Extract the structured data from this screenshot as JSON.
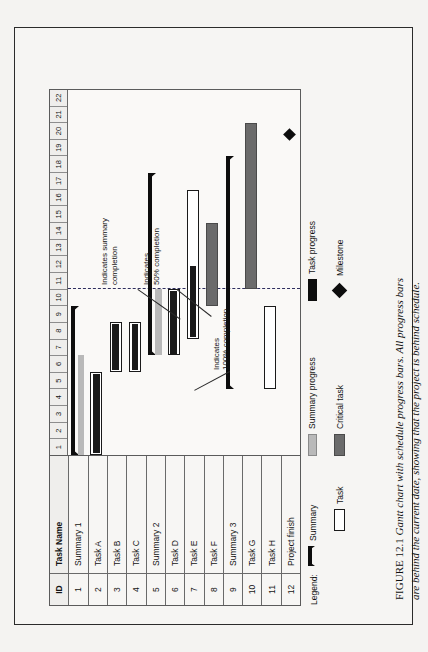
{
  "figure": {
    "caption_label": "FIGURE 12.1",
    "caption_text": "Gantt chart with schedule progress bars. All progress bars are behind the current date, showing that the project is behind schedule."
  },
  "table": {
    "headers": {
      "id": "ID",
      "name": "Task Name"
    },
    "rows": [
      {
        "id": "1",
        "name": "Summary 1"
      },
      {
        "id": "2",
        "name": "Task A"
      },
      {
        "id": "3",
        "name": "Task B"
      },
      {
        "id": "4",
        "name": "Task C"
      },
      {
        "id": "5",
        "name": "Summary 2"
      },
      {
        "id": "6",
        "name": "Task D"
      },
      {
        "id": "7",
        "name": "Task E"
      },
      {
        "id": "8",
        "name": "Task F"
      },
      {
        "id": "9",
        "name": "Summary 3"
      },
      {
        "id": "10",
        "name": "Task G"
      },
      {
        "id": "11",
        "name": "Task H"
      },
      {
        "id": "12",
        "name": "Project finish"
      }
    ]
  },
  "timeline": {
    "columns": [
      "1",
      "2",
      "3",
      "4",
      "5",
      "6",
      "7",
      "8",
      "9",
      "10",
      "11",
      "12",
      "13",
      "14",
      "15",
      "16",
      "17",
      "18",
      "19",
      "20",
      "21",
      "22"
    ],
    "current_date_column": 11
  },
  "annotations": [
    {
      "id": "anno-summary-completion",
      "text": "Indicates summary\ncompletion"
    },
    {
      "id": "anno-50-completion",
      "text": "Indicates\n50% completion"
    },
    {
      "id": "anno-100-completion",
      "text": "Indicates\n100% completion"
    }
  ],
  "legend": {
    "title": "Legend:",
    "items": [
      {
        "id": "legend-summary",
        "label": "Summary",
        "swatch": "summary-bar-icon",
        "color": "#0d0d0d"
      },
      {
        "id": "legend-summary-progress",
        "label": "Summary progress",
        "swatch": "summary-progress-icon",
        "color": "#b9b9b9"
      },
      {
        "id": "legend-task-progress",
        "label": "Task progress",
        "swatch": "task-progress-icon",
        "color": "#0d0d0d"
      },
      {
        "id": "legend-task",
        "label": "Task",
        "swatch": "task-bar-icon",
        "color": "#ffffff"
      },
      {
        "id": "legend-critical-task",
        "label": "Critical task",
        "swatch": "critical-task-icon",
        "color": "#6b6b6b"
      },
      {
        "id": "legend-milestone",
        "label": "Milestone",
        "swatch": "milestone-diamond-icon",
        "color": "#0d0d0d"
      }
    ]
  },
  "chart_data": {
    "type": "bar",
    "title": "Gantt chart with schedule progress bars",
    "xlabel": "",
    "ylabel": "",
    "xlim": [
      1,
      23
    ],
    "grid": true,
    "legend_position": "bottom",
    "current_date": 11,
    "categories": [
      "Summary 1",
      "Task A",
      "Task B",
      "Task C",
      "Summary 2",
      "Task D",
      "Task E",
      "Task F",
      "Summary 3",
      "Task G",
      "Task H",
      "Project finish"
    ],
    "tasks": [
      {
        "id": "1",
        "name": "Summary 1",
        "kind": "summary",
        "start": 1,
        "finish": 9,
        "progress_end": 7,
        "percent_complete": 75
      },
      {
        "id": "2",
        "name": "Task A",
        "kind": "task",
        "start": 1,
        "finish": 5,
        "progress_end": 5,
        "percent_complete": 100
      },
      {
        "id": "3",
        "name": "Task B",
        "kind": "task",
        "start": 6,
        "finish": 8,
        "progress_end": 8,
        "percent_complete": 100
      },
      {
        "id": "4",
        "name": "Task C",
        "kind": "task",
        "start": 6,
        "finish": 8,
        "progress_end": 8,
        "percent_complete": 100
      },
      {
        "id": "5",
        "name": "Summary 2",
        "kind": "summary",
        "start": 7,
        "finish": 17,
        "progress_end": 11,
        "percent_complete": 40
      },
      {
        "id": "6",
        "name": "Task D",
        "kind": "task",
        "start": 7,
        "finish": 10,
        "progress_end": 10,
        "percent_complete": 100
      },
      {
        "id": "7",
        "name": "Task E",
        "kind": "task",
        "start": 8,
        "finish": 16,
        "progress_end": 10,
        "percent_complete": 50
      },
      {
        "id": "8",
        "name": "Task F",
        "kind": "critical",
        "start": 10,
        "finish": 14,
        "progress_end": 10,
        "percent_complete": 0
      },
      {
        "id": "9",
        "name": "Summary 3",
        "kind": "summary",
        "start": 5,
        "finish": 18,
        "progress_end": 5,
        "percent_complete": 0
      },
      {
        "id": "10",
        "name": "Task G",
        "kind": "critical",
        "start": 11,
        "finish": 20,
        "progress_end": 11,
        "percent_complete": 0
      },
      {
        "id": "11",
        "name": "Task H",
        "kind": "task",
        "start": 5,
        "finish": 9,
        "progress_end": 5,
        "percent_complete": 0
      },
      {
        "id": "12",
        "name": "Project finish",
        "kind": "milestone",
        "start": 20,
        "finish": 20,
        "progress_end": 20,
        "percent_complete": 0
      }
    ]
  }
}
